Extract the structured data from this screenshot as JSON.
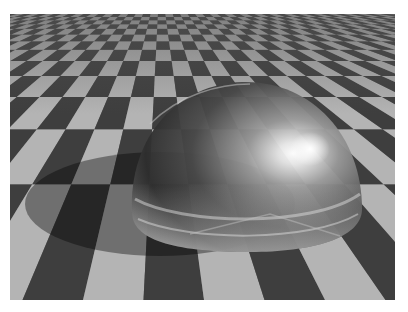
{
  "image": {
    "description": "Ray-traced render of a reflective/refractive glass hemisphere resting on a grey checkerboard plane, casting a shadow to the lower left",
    "subject": "glass hemisphere",
    "background": "checkerboard floor in perspective",
    "colors": {
      "page_background": "#ffffff",
      "light_tile": "#b4b4b4",
      "dark_tile": "#3e3e3e",
      "shadow": "#000000",
      "sphere_core": "#2a2a2a",
      "highlight": "#ffffff"
    },
    "frame": {
      "left": 10,
      "top": 14,
      "width": 385,
      "height": 286
    }
  }
}
